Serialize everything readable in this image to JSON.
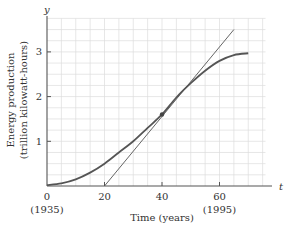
{
  "chart_data": {
    "type": "line",
    "title": "",
    "xlabel": "Time (years)",
    "ylabel": "Energy production (trillion kilowatt-hours)",
    "ylabel_lines": [
      "Energy production",
      "(trillion kilowatt-hours)"
    ],
    "x_axis_var": "t",
    "y_axis_var": "y",
    "xlim": [
      0,
      76
    ],
    "ylim": [
      0,
      3.75
    ],
    "x_ticks": [
      {
        "value": 0,
        "label": "0",
        "sublabel": "(1935)"
      },
      {
        "value": 20,
        "label": "20",
        "sublabel": ""
      },
      {
        "value": 40,
        "label": "40",
        "sublabel": ""
      },
      {
        "value": 60,
        "label": "60",
        "sublabel": "(1995)"
      }
    ],
    "y_ticks": [
      {
        "value": 1,
        "label": "1"
      },
      {
        "value": 2,
        "label": "2"
      },
      {
        "value": 3,
        "label": "3"
      }
    ],
    "grid": true,
    "grid_x_step": 5,
    "grid_y_step": 0.25,
    "series": [
      {
        "name": "Energy production curve",
        "x": [
          0,
          5,
          10,
          15,
          20,
          25,
          30,
          35,
          40,
          45,
          50,
          55,
          60,
          65,
          70
        ],
        "values": [
          0.02,
          0.06,
          0.15,
          0.3,
          0.5,
          0.75,
          1.0,
          1.3,
          1.6,
          1.98,
          2.3,
          2.58,
          2.8,
          2.93,
          2.97
        ],
        "color": "#555555"
      },
      {
        "name": "Tangent line at t=40",
        "x": [
          20,
          65
        ],
        "values": [
          0.0,
          3.5
        ],
        "color": "#555555"
      }
    ],
    "points": [
      {
        "name": "Point of tangency",
        "x": 40,
        "y": 1.6
      }
    ],
    "legend": null
  }
}
